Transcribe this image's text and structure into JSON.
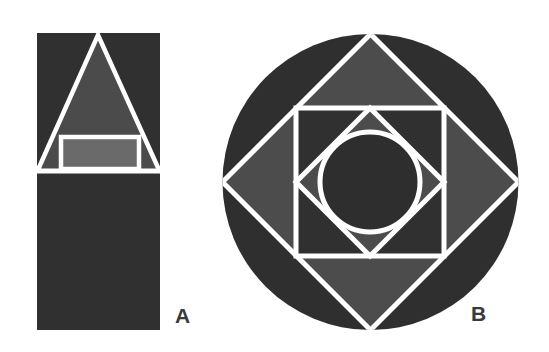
{
  "figures": [
    {
      "id": "A",
      "label": "A",
      "description": "Tall dark rectangle with white-outlined triangle on top portion containing an inner lighter rectangle; lower half solid dark",
      "elements": {
        "outer_rect": {
          "x": 37,
          "y": 33,
          "w": 123,
          "h": 297
        },
        "triangle": {
          "apex": [
            98,
            35
          ],
          "base_left": [
            38,
            170
          ],
          "base_right": [
            159,
            170
          ]
        },
        "divider_y": 170,
        "inner_rect": {
          "x": 61,
          "y": 137,
          "w": 78,
          "h": 31
        }
      }
    },
    {
      "id": "B",
      "label": "B",
      "description": "Dark circle with inscribed white-outlined diamond, inner square, inner diamond and inscribed circle",
      "elements": {
        "outer_circle": {
          "cx": 370.5,
          "cy": 182,
          "r": 148
        },
        "outer_diamond": {
          "top": [
            370.5,
            34
          ],
          "right": [
            518.5,
            182
          ],
          "bottom": [
            370.5,
            330
          ],
          "left": [
            222.5,
            182
          ]
        },
        "inner_square": {
          "x": 296,
          "y": 108,
          "w": 148,
          "h": 148
        },
        "inner_diamond": {
          "top": [
            370,
            108
          ],
          "right": [
            444,
            182
          ],
          "bottom": [
            370,
            256
          ],
          "left": [
            296,
            182
          ]
        },
        "inner_circle": {
          "cx": 370,
          "cy": 182,
          "r": 50
        }
      }
    }
  ],
  "colors": {
    "background": "#ffffff",
    "darkest": "#2f2f2f",
    "dark": "#333333",
    "medium": "#4c4c4c",
    "light": "#6c6c6c",
    "stroke": "#ffffff",
    "label": "#3a3a3a"
  }
}
